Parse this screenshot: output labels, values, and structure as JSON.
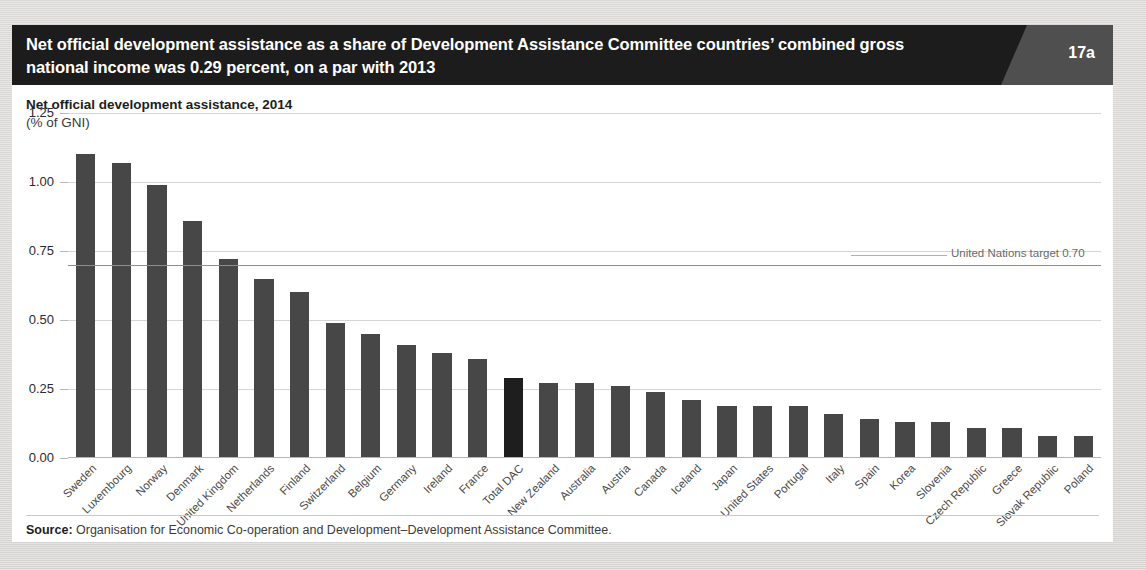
{
  "header": {
    "title": "Net official development assistance as a share of Development Assistance Committee countries’ combined gross national income was 0.29 percent, on a par with 2013",
    "badge": "17a"
  },
  "subtitle": {
    "line1": "Net official development assistance, 2014",
    "line2": "(% of GNI)"
  },
  "annotation": {
    "target_label": "United Nations target 0.70",
    "target_value": 0.7
  },
  "source": {
    "label": "Source:",
    "text": " Organisation for Economic Co-operation and Development–Development Assistance Committee."
  },
  "colors": {
    "bar": "#474747",
    "bar_highlight": "#1e1e1e",
    "header_bg": "#1c1c1c",
    "badge_bg": "#4f4f4f",
    "panel_bg": "#ffffff",
    "page_bg": "#dcdcdc",
    "gridline": "#d5d5d5",
    "target_line": "#8d8d8d"
  },
  "chart_data": {
    "type": "bar",
    "title": "Net official development assistance, 2014",
    "subtitle": "(% of GNI)",
    "xlabel": "",
    "ylabel": "(% of GNI)",
    "ylim": [
      0,
      1.25
    ],
    "yticks": [
      0.0,
      0.25,
      0.5,
      0.75,
      1.0,
      1.25
    ],
    "ytick_labels": [
      "0.00",
      "0.25",
      "0.50",
      "0.75",
      "1.00",
      "1.25"
    ],
    "grid": true,
    "legend": "none",
    "highlight_category": "Total DAC",
    "reference_line": {
      "value": 0.7,
      "label": "United Nations target 0.70"
    },
    "categories": [
      "Sweden",
      "Luxembourg",
      "Norway",
      "Denmark",
      "United Kingdom",
      "Netherlands",
      "Finland",
      "Switzerland",
      "Belgium",
      "Germany",
      "Ireland",
      "France",
      "Total DAC",
      "New Zealand",
      "Australia",
      "Austria",
      "Canada",
      "Iceland",
      "Japan",
      "United States",
      "Portugal",
      "Italy",
      "Spain",
      "Korea",
      "Slovenia",
      "Czech Republic",
      "Greece",
      "Slovak Republic",
      "Poland"
    ],
    "values": [
      1.1,
      1.07,
      0.99,
      0.86,
      0.72,
      0.65,
      0.6,
      0.49,
      0.45,
      0.41,
      0.38,
      0.36,
      0.29,
      0.27,
      0.27,
      0.26,
      0.24,
      0.21,
      0.19,
      0.19,
      0.19,
      0.16,
      0.14,
      0.13,
      0.13,
      0.11,
      0.11,
      0.08,
      0.08
    ]
  }
}
